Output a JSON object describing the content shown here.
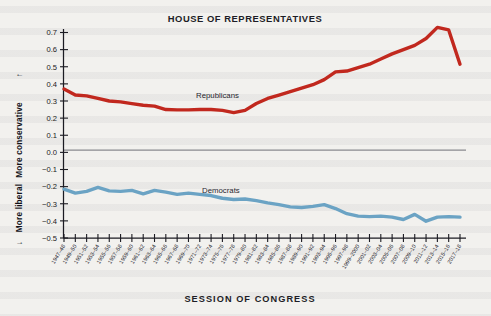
{
  "figure": {
    "title": "HOUSE OF REPRESENTATIVES",
    "xlabel": "SESSION OF CONGRESS",
    "ylabel_top": "More conservative",
    "ylabel_bottom": "More liberal",
    "arrow_up": "↑",
    "arrow_down": "↓",
    "republican_label": "Republicans",
    "democrat_label": "Democrats",
    "republican_color": "#c1281e",
    "democrat_color": "#6ba3c4"
  },
  "chart_data": {
    "type": "line",
    "title": "HOUSE OF REPRESENTATIVES",
    "xlabel": "SESSION OF CONGRESS",
    "ylabel": "More liberal ← | → More conservative",
    "ylim": [
      -0.5,
      0.7
    ],
    "yticks": [
      0.7,
      0.6,
      0.5,
      0.4,
      0.3,
      0.2,
      0.1,
      0.0,
      -0.1,
      -0.2,
      -0.3,
      -0.4,
      -0.5
    ],
    "ytick_labels": [
      "0.7",
      "0.6",
      "0.5",
      "0.4",
      "0.3",
      "0.2",
      "0.1",
      "0.0",
      "−0.1",
      "−0.2",
      "−0.3",
      "−0.4",
      "−0.5"
    ],
    "grid": false,
    "legend_position": "inline-annotation",
    "categories": [
      "1947–48",
      "1949–50",
      "1951–52",
      "1953–54",
      "1955–56",
      "1957–58",
      "1959–60",
      "1961–62",
      "1963–64",
      "1965–66",
      "1967–68",
      "1969–70",
      "1971–72",
      "1973–74",
      "1975–76",
      "1977–78",
      "1979–80",
      "1981–82",
      "1983–84",
      "1985–86",
      "1987–88",
      "1989–90",
      "1991–92",
      "1993–94",
      "1995–96",
      "1997–98",
      "1999–2000",
      "2001–02",
      "2003–04",
      "2005–06",
      "2007–08",
      "2009–10",
      "2011–12",
      "2013–14",
      "2015–16",
      "2017–18"
    ],
    "series": [
      {
        "name": "Republicans",
        "color": "#c1281e",
        "values": [
          0.37,
          0.335,
          0.33,
          0.315,
          0.3,
          0.295,
          0.285,
          0.275,
          0.27,
          0.25,
          0.248,
          0.248,
          0.25,
          0.25,
          0.245,
          0.232,
          0.245,
          0.285,
          0.315,
          0.335,
          0.355,
          0.375,
          0.395,
          0.425,
          0.47,
          0.475,
          0.495,
          0.515,
          0.545,
          0.575,
          0.6,
          0.625,
          0.665,
          0.73,
          0.715,
          0.515
        ]
      },
      {
        "name": "Democrats",
        "color": "#6ba3c4",
        "values": [
          -0.215,
          -0.238,
          -0.228,
          -0.205,
          -0.225,
          -0.228,
          -0.222,
          -0.242,
          -0.222,
          -0.232,
          -0.245,
          -0.238,
          -0.245,
          -0.252,
          -0.268,
          -0.275,
          -0.272,
          -0.282,
          -0.295,
          -0.305,
          -0.318,
          -0.322,
          -0.315,
          -0.305,
          -0.328,
          -0.358,
          -0.372,
          -0.375,
          -0.372,
          -0.378,
          -0.392,
          -0.362,
          -0.402,
          -0.378,
          -0.375,
          -0.378
        ]
      }
    ]
  }
}
